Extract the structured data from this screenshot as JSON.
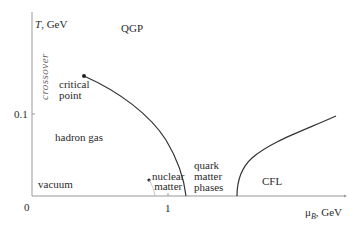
{
  "axes": {
    "y_label_var": "T",
    "y_label_unit": ", GeV",
    "x_label_var": "μ",
    "x_label_sub": "B",
    "x_label_unit": ", GeV",
    "y_tick": "0.1",
    "x_origin": "0",
    "x_tick": "1"
  },
  "regions": {
    "qgp": "QGP",
    "crossover": "crossover",
    "critical_point_line1": "critical",
    "critical_point_line2": "point",
    "hadron_gas": "hadron gas",
    "vacuum": "vacuum",
    "nuclear_matter_line1": "nuclear",
    "nuclear_matter_line2": "matter",
    "quark_line1": "quark",
    "quark_line2": "matter",
    "quark_line3": "phases",
    "cfl": "CFL"
  },
  "colors": {
    "line": "#333333",
    "axis": "#888888",
    "faint": "#bbbbbb"
  }
}
